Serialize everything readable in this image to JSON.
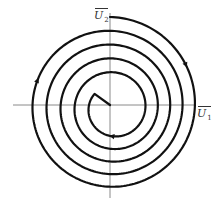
{
  "diagram": {
    "type": "phase-portrait-spiral",
    "axes": {
      "horizontal": {
        "label_main": "U",
        "label_sub": "1",
        "overbar": true
      },
      "vertical": {
        "label_main": "U",
        "label_sub": "2",
        "overbar": true
      }
    },
    "spiral": {
      "direction": "clockwise-inward",
      "turns": 5,
      "outer_radius": 88,
      "inner_radius": 24,
      "ends_at": "origin"
    },
    "colors": {
      "curve": "#111111",
      "axis": "#8a8a8a",
      "background": "#ffffff"
    }
  }
}
